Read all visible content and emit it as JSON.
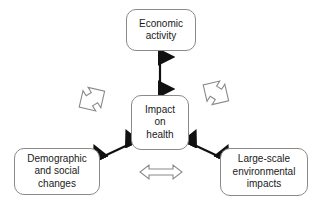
{
  "diagram": {
    "background_color": "#ffffff",
    "nodes": {
      "economic": {
        "label": "Economic\nactivity"
      },
      "impact": {
        "label": "Impact\non\nhealth"
      },
      "demographic": {
        "label": "Demographic\nand social\nchanges"
      },
      "environmental": {
        "label": "Large-scale\nenvironmental\nimpacts"
      }
    },
    "connectors": [
      {
        "name": "economic-impact-connector",
        "style": "solid",
        "heads": "double",
        "color": "#111111"
      },
      {
        "name": "impact-demographic-connector",
        "style": "solid",
        "heads": "double",
        "color": "#111111"
      },
      {
        "name": "impact-environmental-connector",
        "style": "solid",
        "heads": "double",
        "color": "#111111"
      }
    ],
    "hollow_arrows": [
      {
        "name": "left-hollow-arrow",
        "orientation": "diagonal-up-right",
        "outline_color": "#8a8a8a",
        "fill_color": "#ffffff"
      },
      {
        "name": "right-hollow-arrow",
        "orientation": "diagonal-down-right",
        "outline_color": "#8a8a8a",
        "fill_color": "#ffffff"
      },
      {
        "name": "bottom-hollow-arrow",
        "orientation": "horizontal",
        "outline_color": "#8a8a8a",
        "fill_color": "#ffffff"
      }
    ]
  }
}
